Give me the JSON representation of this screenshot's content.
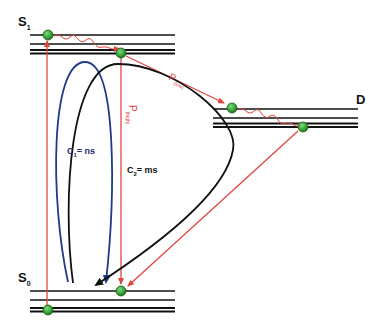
{
  "diagram": {
    "type": "energy-level (Jablonski-style) diagram",
    "states": [
      {
        "id": "S1",
        "label_main": "S",
        "label_sub": "1",
        "levels_y": [
          35,
          44,
          50,
          53
        ]
      },
      {
        "id": "D",
        "label_main": "D",
        "label_sub": "",
        "levels_y": [
          109,
          118,
          123,
          127
        ]
      },
      {
        "id": "S0",
        "label_main": "S",
        "label_sub": "0",
        "levels_y": [
          291,
          300,
          308,
          311
        ]
      }
    ],
    "transitions": [
      {
        "id": "excitation",
        "from": "S0",
        "to": "S1",
        "color": "#e0463f"
      },
      {
        "id": "p_high",
        "label_main": "P",
        "label_sub": "(high)",
        "from": "S1",
        "to": "S0",
        "color": "#e0463f"
      },
      {
        "id": "p_low",
        "label_main": "P",
        "label_sub": "(low)",
        "from": "S1",
        "to": "D",
        "color": "#e0463f"
      },
      {
        "id": "d_to_s0",
        "from": "D",
        "to": "S0",
        "color": "#e0463f"
      }
    ],
    "cycles": [
      {
        "id": "C1",
        "label_main": "C",
        "label_sub": "1",
        "label_rest": "= ns",
        "color": "#1f3a8a"
      },
      {
        "id": "C2",
        "label_main": "C",
        "label_sub": "2",
        "label_rest": "= ms",
        "color": "#111111"
      }
    ],
    "colors": {
      "level_line": "#111111",
      "arrow_red": "#e0463f",
      "loop_blue": "#1f3a8a",
      "loop_black": "#111111",
      "dot_fill": "#3aa83a",
      "dot_stroke": "#1f5f1f"
    }
  }
}
